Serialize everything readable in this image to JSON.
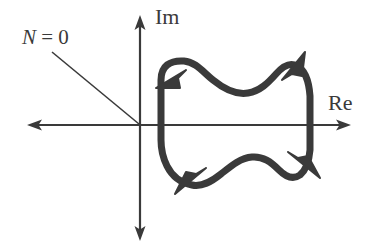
{
  "figure": {
    "type": "nyquist-contour-diagram",
    "width": 368,
    "height": 252,
    "background_color": "#ffffff",
    "axis_color": "#3a3a3a",
    "contour_color": "#3a3a3a",
    "leader_color": "#3a3a3a"
  },
  "axes": {
    "imaginary": {
      "label": "Im",
      "orientation": "vertical",
      "x": 140,
      "y_top": 18,
      "y_bottom": 238,
      "arrow_heads": "both"
    },
    "real": {
      "label": "Re",
      "orientation": "horizontal",
      "y": 125,
      "x_left": 30,
      "x_right": 348,
      "arrow_heads": "both"
    },
    "origin": {
      "x": 140,
      "y": 125
    }
  },
  "annotation": {
    "text_symbol": "N",
    "text_rest": " = 0",
    "full_text": "N = 0",
    "leader_from": {
      "x": 52,
      "y": 52
    },
    "leader_to": {
      "x": 139,
      "y": 124
    }
  },
  "contour": {
    "name": "closed-contour",
    "description": "closed wavy contour in the right half-plane encircling no points, with four direction arrowheads indicating clockwise traversal",
    "stroke_width": 7,
    "encirclement_count": 0,
    "arrow_markers": [
      {
        "name": "arrow-top-left",
        "x": 170,
        "y": 77,
        "direction": "down-left"
      },
      {
        "name": "arrow-top-right",
        "x": 292,
        "y": 65,
        "direction": "up-right"
      },
      {
        "name": "arrow-bottom-left",
        "x": 189,
        "y": 180,
        "direction": "down-left"
      },
      {
        "name": "arrow-bottom-right",
        "x": 305,
        "y": 165,
        "direction": "down-right"
      }
    ]
  }
}
